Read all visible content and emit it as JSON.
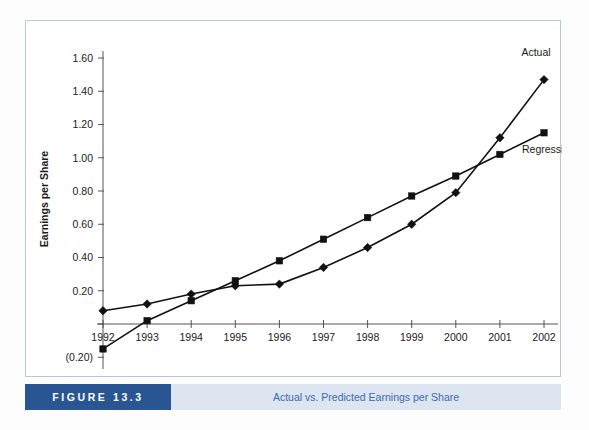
{
  "figure": {
    "tag": "FIGURE 13.3",
    "caption": "Actual vs. Predicted Earnings per Share",
    "tag_bg": "#2a5593",
    "caption_bg": "#dde5f0",
    "caption_fg": "#3a6bb0",
    "frame_border": "#b9c6dd"
  },
  "chart_data": {
    "type": "line",
    "title": "",
    "xlabel": "",
    "ylabel": "Earnings per Share",
    "x": [
      1992,
      1993,
      1994,
      1995,
      1996,
      1997,
      1998,
      1999,
      2000,
      2001,
      2002
    ],
    "xtick_labels": [
      "1992",
      "1993",
      "1994",
      "1995",
      "1996",
      "1997",
      "1998",
      "1999",
      "2000",
      "2001",
      "2002"
    ],
    "ytick_labels": [
      "1.60",
      "1.40",
      "1.20",
      "1.00",
      "0.80",
      "0.60",
      "0.40",
      "0.20",
      "",
      "(0.20)"
    ],
    "ytick_values": [
      1.6,
      1.4,
      1.2,
      1.0,
      0.8,
      0.6,
      0.4,
      0.2,
      0.0,
      -0.2
    ],
    "ylim": [
      -0.2,
      1.6
    ],
    "xlim": [
      1992,
      2002
    ],
    "grid": false,
    "legend_position": "inline-right",
    "series": [
      {
        "name": "Actual",
        "marker": "diamond",
        "color": "#111111",
        "values": [
          0.08,
          0.12,
          0.18,
          0.23,
          0.24,
          0.34,
          0.46,
          0.6,
          0.79,
          1.12,
          1.47
        ]
      },
      {
        "name": "Regression",
        "marker": "square",
        "color": "#111111",
        "values": [
          -0.15,
          0.02,
          0.14,
          0.26,
          0.38,
          0.51,
          0.64,
          0.77,
          0.89,
          1.02,
          1.15
        ]
      }
    ],
    "annotations": [
      {
        "text": "Actual",
        "series": "Actual"
      },
      {
        "text": "Regression",
        "series": "Regression"
      }
    ]
  }
}
